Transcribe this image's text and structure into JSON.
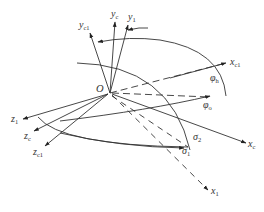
{
  "diagram": {
    "type": "3d-coordinate-frame-rotation",
    "origin": {
      "label": "O"
    },
    "axes": {
      "y_c1": {
        "base": "y",
        "sub": "c1"
      },
      "y_c": {
        "base": "y",
        "sub": "c"
      },
      "y_1": {
        "base": "y",
        "sub": "1"
      },
      "x_c1": {
        "base": "x",
        "sub": "c1"
      },
      "x_c": {
        "base": "x",
        "sub": "c"
      },
      "x_1": {
        "base": "x",
        "sub": "1"
      },
      "z_1": {
        "base": "z",
        "sub": "1"
      },
      "z_c": {
        "base": "z",
        "sub": "c"
      },
      "z_c1": {
        "base": "z",
        "sub": "c1"
      }
    },
    "angles": {
      "phi_h": {
        "base": "φ",
        "sub": "h"
      },
      "phi_o": {
        "base": "φ",
        "sub": "o"
      },
      "sigma_1": {
        "base": "σ",
        "sub": "1"
      },
      "sigma_2": {
        "base": "σ",
        "sub": "2"
      }
    },
    "colors": {
      "line": "#333333",
      "background": "#ffffff"
    }
  }
}
